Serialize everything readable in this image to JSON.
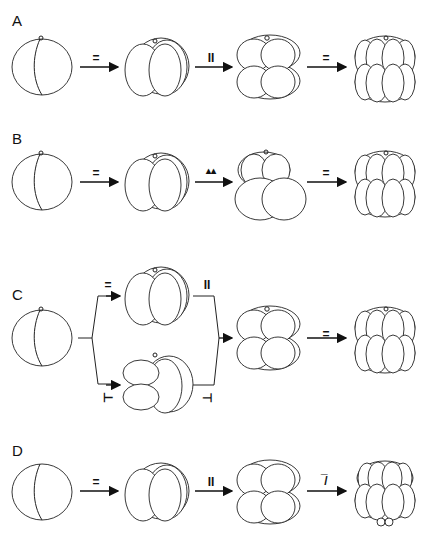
{
  "figure": {
    "panels": [
      {
        "label": "A",
        "stages": [
          "2-cell",
          "4-cell",
          "8-cell",
          "16-cell"
        ],
        "transitions": [
          "=",
          "II",
          "="
        ]
      },
      {
        "label": "B",
        "stages": [
          "2-cell",
          "4-cell",
          "8-cell (unequal)",
          "16-cell"
        ],
        "transitions": [
          "=",
          "▲▲",
          "="
        ]
      },
      {
        "label": "C",
        "stages": [
          "2-cell",
          "4-cell (equal)",
          "4-cell (T-shape)",
          "8-cell",
          "16-cell"
        ],
        "transitions": [
          "=",
          "⊢",
          "II",
          "⊣",
          "="
        ]
      },
      {
        "label": "D",
        "stages": [
          "2-cell",
          "4-cell",
          "8-cell",
          "16-cell (with micromeres)"
        ],
        "transitions": [
          "=",
          "II",
          "‾∕"
        ]
      }
    ]
  },
  "labels": {
    "A": "A",
    "B": "B",
    "C": "C",
    "D": "D",
    "A_t1": "=",
    "A_t2": "II",
    "A_t3": "=",
    "B_t1": "=",
    "B_t2": "▴▴",
    "B_t3": "=",
    "C_t1": "=",
    "C_t2": "⊢",
    "C_t3": "II",
    "C_t4": "⊣",
    "C_t5": "=",
    "D_t1": "=",
    "D_t2": "II",
    "D_t3": "̅/"
  }
}
